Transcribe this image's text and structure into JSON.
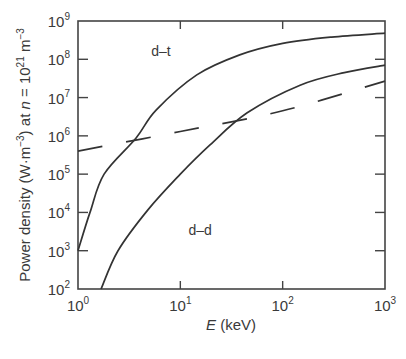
{
  "chart_data": {
    "type": "line",
    "title": "",
    "xlabel": "E (keV)",
    "xlabel_italic_part": "E",
    "xlabel_rest": " (keV)",
    "ylabel": "Power density (W·m⁻³) at n = 10²¹ m⁻³",
    "ylabel_parts": {
      "prefix": "Power density (W·m",
      "sup1": "−3",
      "mid": ") at ",
      "italic": "n",
      "eq": " = 10",
      "sup2": "21",
      "unit": " m",
      "sup3": "−3"
    },
    "xscale": "log",
    "yscale": "log",
    "xlim": [
      1,
      1000
    ],
    "ylim": [
      100,
      1000000000
    ],
    "grid": false,
    "legend": "none (curves labeled inline)",
    "x_ticks": [
      {
        "value": 1,
        "base": "10",
        "exp": "0"
      },
      {
        "value": 10,
        "base": "10",
        "exp": "1"
      },
      {
        "value": 100,
        "base": "10",
        "exp": "2"
      },
      {
        "value": 1000,
        "base": "10",
        "exp": "3"
      }
    ],
    "y_ticks": [
      {
        "value": 100,
        "base": "10",
        "exp": "2"
      },
      {
        "value": 1000,
        "base": "10",
        "exp": "3"
      },
      {
        "value": 10000,
        "base": "10",
        "exp": "4"
      },
      {
        "value": 100000,
        "base": "10",
        "exp": "5"
      },
      {
        "value": 1000000,
        "base": "10",
        "exp": "6"
      },
      {
        "value": 10000000,
        "base": "10",
        "exp": "7"
      },
      {
        "value": 100000000,
        "base": "10",
        "exp": "8"
      },
      {
        "value": 1000000000,
        "base": "10",
        "exp": "9"
      }
    ],
    "series": [
      {
        "name": "d–t",
        "style": "solid",
        "label_pos": {
          "E": 5.2,
          "P": 120000000
        },
        "x": [
          1,
          1.31,
          1.8,
          3.7,
          5.8,
          14.5,
          38,
          100,
          300,
          1000
        ],
        "y": [
          1000,
          10000,
          100000,
          880000,
          4700000,
          39000000,
          130000000,
          260000000,
          380000000,
          480000000
        ]
      },
      {
        "name": "d–d",
        "style": "solid",
        "label_pos": {
          "E": 12,
          "P": 2600
        },
        "x": [
          1.68,
          2.46,
          4.8,
          10,
          19.5,
          45,
          148,
          400,
          1000
        ],
        "y": [
          100,
          1000,
          11500,
          100000,
          580000,
          4000000,
          21000000,
          45000000,
          70000000
        ]
      },
      {
        "name": "bremsstrahlung",
        "style": "dashed",
        "label_pos": null,
        "x": [
          1,
          10,
          100,
          1000
        ],
        "y": [
          400000,
          1300000,
          4500000,
          27000000
        ]
      }
    ]
  }
}
